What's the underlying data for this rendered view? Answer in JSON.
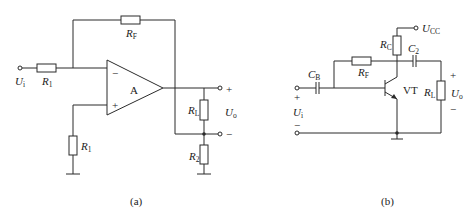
{
  "figure_a": {
    "caption": "(a)",
    "opamp_label": "A",
    "opamp_inputs": {
      "inverting": "−",
      "noninverting": "+"
    },
    "input_label": {
      "main": "U",
      "sub": "i"
    },
    "output_label": {
      "main": "U",
      "sub": "o"
    },
    "output_polarity": {
      "plus": "+",
      "minus": "−"
    },
    "resistors": [
      {
        "main": "R",
        "sub": "1",
        "role": "input"
      },
      {
        "main": "R",
        "sub": "F",
        "role": "feedback"
      },
      {
        "main": "R",
        "sub": "1",
        "role": "noninverting-to-ground"
      },
      {
        "main": "R",
        "sub": "L",
        "role": "load"
      },
      {
        "main": "R",
        "sub": "2",
        "role": "sense-to-ground"
      }
    ]
  },
  "figure_b": {
    "caption": "(b)",
    "transistor_label": "VT",
    "supply_label": {
      "main": "U",
      "sub": "CC"
    },
    "input_label": {
      "main": "U",
      "sub": "i"
    },
    "input_polarity": {
      "plus": "+",
      "minus": "−"
    },
    "output_label": {
      "main": "U",
      "sub": "o"
    },
    "output_polarity": {
      "plus": "+",
      "minus": "−"
    },
    "components": [
      {
        "main": "C",
        "sub": "B",
        "type": "capacitor"
      },
      {
        "main": "R",
        "sub": "F",
        "type": "resistor"
      },
      {
        "main": "R",
        "sub": "C",
        "type": "resistor"
      },
      {
        "main": "C",
        "sub": "2",
        "type": "capacitor"
      },
      {
        "main": "R",
        "sub": "L",
        "type": "resistor"
      }
    ]
  }
}
